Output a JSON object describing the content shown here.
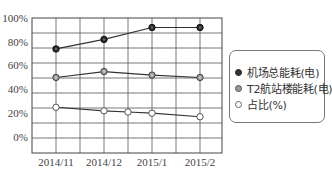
{
  "chart_data": {
    "type": "line",
    "title": "",
    "xlabel": "",
    "ylabel": "",
    "categories": [
      "2014/11",
      "2014/12",
      "2015/1",
      "2015/2"
    ],
    "y_ticks": [
      "100%",
      "80%",
      "60%",
      "40%",
      "20%",
      "0%"
    ],
    "ylim": [
      -13,
      100
    ],
    "grid": true,
    "legend_position": "right",
    "series": [
      {
        "name": "机场总能耗(电)",
        "marker": "dark-filled-circle",
        "color": "#333333",
        "values": [
          74,
          82,
          92,
          92
        ]
      },
      {
        "name": "T2航站楼能耗(电)",
        "marker": "gray-filled-circle",
        "color": "#888888",
        "values": [
          50,
          55,
          52,
          50
        ]
      },
      {
        "name": "占比(%)",
        "marker": "hollow-circle",
        "color": "#ffffff",
        "values": [
          25,
          22,
          20,
          17
        ],
        "extra_points": [
          {
            "x_position": "between 2014/12 and 2015/1",
            "value": 21
          }
        ]
      }
    ]
  },
  "legend": {
    "items": [
      {
        "label": "机场总能耗(电)",
        "marker_fill": "#333333",
        "marker_stroke": "#222222"
      },
      {
        "label": "T2航站楼能耗(电)",
        "marker_fill": "#999999",
        "marker_stroke": "#555555"
      },
      {
        "label": "占比(%)",
        "marker_fill": "#ffffff",
        "marker_stroke": "#666666"
      }
    ]
  }
}
